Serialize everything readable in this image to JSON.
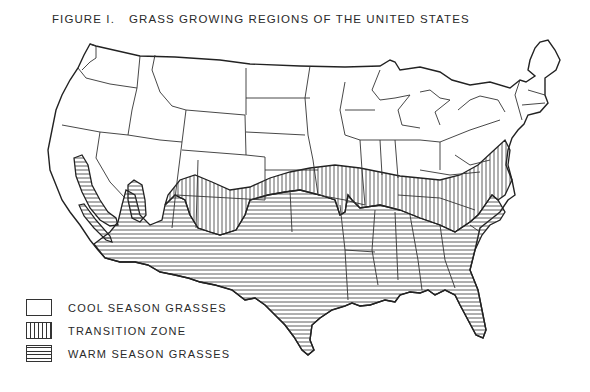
{
  "figure": {
    "number_label": "FIGURE I.",
    "title": "GRASS GROWING REGIONS OF THE UNITED STATES"
  },
  "map": {
    "subject": "Contiguous United States with state boundaries",
    "regions": [
      {
        "id": "cool",
        "name": "Cool season grasses",
        "pattern": "blank",
        "extent": "Northern and western states"
      },
      {
        "id": "transition",
        "name": "Transition zone",
        "pattern": "vertical-hatch",
        "extent": "Band from southern California/Arizona east through Oklahoma, Arkansas, Tennessee, Kentucky, Virginia to Maryland"
      },
      {
        "id": "warm",
        "name": "Warm season grasses",
        "pattern": "horizontal-hatch",
        "extent": "Southern states including Texas, Gulf Coast, Florida, Carolinas, Georgia, Central Valley of California"
      }
    ],
    "colors": {
      "line": "#333333",
      "background": "#ffffff"
    }
  },
  "legend": {
    "items": [
      {
        "id": "cool",
        "label": "COOL SEASON GRASSES"
      },
      {
        "id": "transition",
        "label": "TRANSITION ZONE"
      },
      {
        "id": "warm",
        "label": "WARM SEASON GRASSES"
      }
    ]
  }
}
